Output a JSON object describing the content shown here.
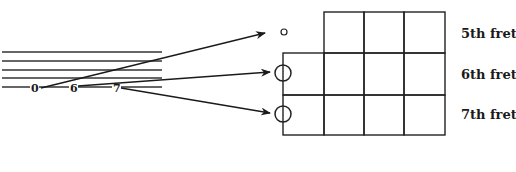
{
  "diagram": {
    "type": "guitar-fingering-mapping",
    "tab": {
      "string_count": 5,
      "fret_numbers": [
        "0",
        "6",
        "7"
      ]
    },
    "fretboard": {
      "fret_labels": [
        "5th fret",
        "6th fret",
        "7th fret"
      ],
      "rows": 3,
      "columns": 4
    },
    "markers": [
      {
        "fret": "5th fret",
        "kind": "open-small-circle"
      },
      {
        "fret": "6th fret",
        "kind": "large-circle"
      },
      {
        "fret": "7th fret",
        "kind": "large-circle"
      }
    ],
    "arrows": [
      {
        "from": "0",
        "to": "5th fret"
      },
      {
        "from": "6",
        "to": "6th fret"
      },
      {
        "from": "7",
        "to": "7th fret"
      }
    ],
    "colors": {
      "ink": "#1a1a1a",
      "background": "#ffffff"
    }
  }
}
